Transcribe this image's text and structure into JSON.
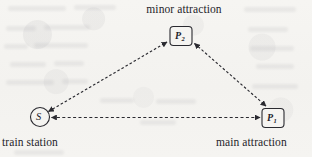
{
  "diagram": {
    "background_color": "#f5f4f1",
    "ink_color": "#2a2a30",
    "labels": {
      "minor_attraction": "minor attraction",
      "train_station": "train station",
      "main_attraction": "main attraction"
    },
    "nodes": [
      {
        "id": "S",
        "glyph": "S",
        "subscript": "",
        "shape": "circle",
        "role": "train station",
        "x": 40,
        "y": 117,
        "radius": 9.5
      },
      {
        "id": "P2",
        "glyph": "P",
        "subscript": "2",
        "shape": "rounded-rect",
        "role": "minor attraction",
        "x": 181,
        "y": 36,
        "width": 22,
        "height": 19
      },
      {
        "id": "P1",
        "glyph": "P",
        "subscript": "1",
        "shape": "rounded-rect",
        "role": "main attraction",
        "x": 273,
        "y": 118,
        "width": 22,
        "height": 19
      }
    ],
    "edges": [
      {
        "id": "edge-s-p2",
        "from": "S",
        "to": "P2",
        "style": "dashed",
        "direction": "bidirectional"
      },
      {
        "id": "edge-p2-p1",
        "from": "P2",
        "to": "P1",
        "style": "dashed",
        "direction": "bidirectional"
      },
      {
        "id": "edge-s-p1",
        "from": "S",
        "to": "P1",
        "style": "dashed",
        "direction": "bidirectional"
      }
    ]
  }
}
